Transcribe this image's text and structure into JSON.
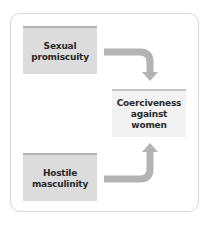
{
  "diagram": {
    "nodes": [
      {
        "id": "sexual-promiscuity",
        "label": "Sexual\npromiscuity",
        "role": "cause"
      },
      {
        "id": "coerciveness",
        "label": "Coerciveness\nagainst\nwomen",
        "role": "outcome"
      },
      {
        "id": "hostile-masculinity",
        "label": "Hostile\nmasculinity",
        "role": "cause"
      }
    ],
    "edges": [
      {
        "from": "sexual-promiscuity",
        "to": "coerciveness",
        "icon": "bent-arrow-down-icon"
      },
      {
        "from": "hostile-masculinity",
        "to": "coerciveness",
        "icon": "bent-arrow-up-icon"
      }
    ],
    "colors": {
      "cause_fill": "#dcdcdc",
      "outcome_fill": "#f2f2f2",
      "stripe": "#b5b5b5",
      "arrow": "#b3b3b3",
      "frame_border": "#d8d8d8",
      "text": "#2a2a2a"
    }
  }
}
